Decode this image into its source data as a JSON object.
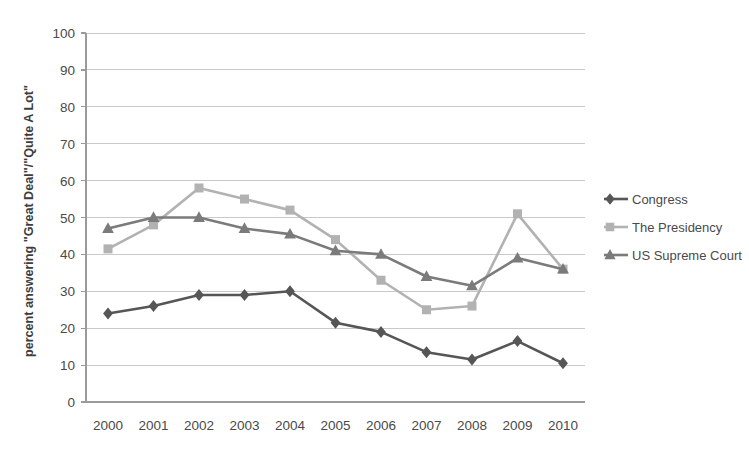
{
  "chart_data": {
    "type": "line",
    "title": "",
    "xlabel": "",
    "ylabel": "percent answering \"Great Deal\"/\"Quite A Lot\"",
    "categories": [
      "2000",
      "2001",
      "2002",
      "2003",
      "2004",
      "2005",
      "2006",
      "2007",
      "2008",
      "2009",
      "2010"
    ],
    "ylim": [
      0,
      100
    ],
    "ytick_step": 10,
    "yticks": [
      "0",
      "10",
      "20",
      "30",
      "40",
      "50",
      "60",
      "70",
      "80",
      "90",
      "100"
    ],
    "grid": true,
    "legend_position": "right",
    "series": [
      {
        "name": "Congress",
        "marker": "diamond",
        "color": "#565656",
        "values": [
          24,
          26,
          29,
          29,
          30,
          21.5,
          19,
          13.5,
          11.5,
          16.5,
          10.5
        ]
      },
      {
        "name": "The Presidency",
        "marker": "square",
        "color": "#b2b2b2",
        "values": [
          41.5,
          48,
          58,
          55,
          52,
          44,
          33,
          25,
          26,
          51,
          36
        ]
      },
      {
        "name": "US Supreme Court",
        "marker": "triangle",
        "color": "#7b7b7b",
        "values": [
          47,
          50,
          50,
          47,
          45.5,
          41,
          40,
          34,
          31.5,
          39,
          36
        ]
      }
    ]
  },
  "legend": {
    "items": [
      {
        "label": "Congress"
      },
      {
        "label": "The Presidency"
      },
      {
        "label": "US Supreme Court"
      }
    ]
  },
  "colors": {
    "congress": "#565656",
    "presidency": "#b2b2b2",
    "supreme_court": "#7b7b7b",
    "gridline": "#c9c9c9",
    "axis": "#9a9a9a",
    "text": "#4a4a4a",
    "background": "#ffffff"
  }
}
